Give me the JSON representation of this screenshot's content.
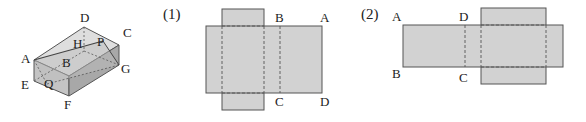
{
  "figure": {
    "cuboid": {
      "labels": {
        "A": "A",
        "B": "B",
        "C": "C",
        "D": "D",
        "E": "E",
        "F": "F",
        "G": "G",
        "H": "H",
        "P": "P",
        "Q": "Q"
      }
    },
    "net1": {
      "number": "(1)",
      "labels": {
        "B": "B",
        "A": "A",
        "C": "C",
        "D": "D"
      }
    },
    "net2": {
      "number": "(2)",
      "labels": {
        "A": "A",
        "D": "D",
        "B": "B",
        "C": "C"
      }
    },
    "colors": {
      "face_fill": "#d2d2d2",
      "side_fill": "#bdbdbd",
      "front_fill": "#a9a9a9",
      "stroke": "#555555"
    }
  }
}
